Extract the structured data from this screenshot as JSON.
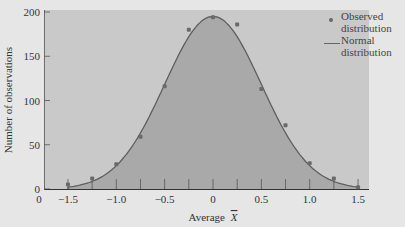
{
  "chart_data": {
    "type": "scatter",
    "title": "",
    "xlabel": "Average X̄",
    "ylabel": "Number of observations",
    "xlim": [
      -1.6,
      1.6
    ],
    "ylim": [
      0,
      200
    ],
    "x_ticks": [
      "0",
      "−1.5",
      "−1.0",
      "−0.5",
      "0",
      "0.5",
      "1.0",
      "1.5"
    ],
    "y_ticks": [
      "0",
      "50",
      "100",
      "150",
      "200"
    ],
    "grid": false,
    "legend_position": "upper right",
    "series": [
      {
        "name": "Observed distribution",
        "kind": "points",
        "x": [
          -1.5,
          -1.25,
          -1.0,
          -0.75,
          -0.5,
          -0.25,
          0.0,
          0.25,
          0.5,
          0.75,
          1.0,
          1.25,
          1.5
        ],
        "y": [
          5,
          12,
          28,
          59,
          116,
          180,
          194,
          186,
          113,
          72,
          29,
          12,
          2
        ]
      },
      {
        "name": "Normal distribution",
        "kind": "curve",
        "mean": 0.0,
        "peak": 195,
        "sd": 0.5
      }
    ]
  },
  "labels": {
    "y_axis_title": "Number of observations",
    "x_axis_title": "Average",
    "x_axis_symbol": "X",
    "legend_observed": "Observed distribution",
    "legend_normal": "Normal distribution"
  },
  "colors": {
    "plot_background": "#c9c9c9",
    "under_curve_fill": "#a9a9a9",
    "curve": "#5e5e5e",
    "points": "#6a6a6a"
  }
}
